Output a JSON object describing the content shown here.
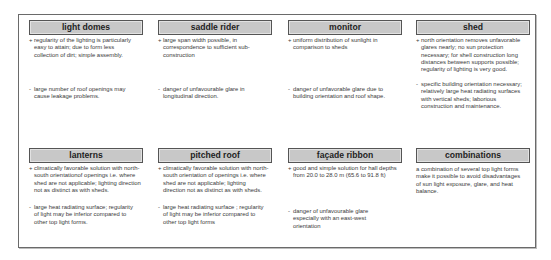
{
  "cells": [
    {
      "header": "light domes",
      "pro_symbol": "+",
      "pro": "regularity of the lighting is particularly easy to attain; due to form less collection of dirt; simple assembly.",
      "con_symbol": "-",
      "con": "large number of roof openings may cause leakage problems."
    },
    {
      "header": "saddle rider",
      "pro_symbol": "+",
      "pro": "large span width possible, in correspondence to sufficient sub-construction",
      "con_symbol": "-",
      "con": "danger of unfavourable glare in longitudinal direction."
    },
    {
      "header": "monitor",
      "pro_symbol": "+",
      "pro": "uniform distribution of sunlight in comparison to sheds",
      "con_symbol": "-",
      "con": "danger of unfavorable glare due to building orientation and roof shape."
    },
    {
      "header": "shed",
      "pro_symbol": "+",
      "pro": "north orientation removes unfavorable glares nearly; no sun protection necessary; for shell construction long distances between supports possible; regularity of lighting is very good.",
      "con_symbol": "-",
      "con": "specific building orientation necessary; relatively large heat radiating surfaces with vertical sheds; laborious construction and maintenance."
    },
    {
      "header": "lanterns",
      "pro_symbol": "+",
      "pro": "climatically favorable solution with north-south orientationof openings i.e. where shed are not applicable; lighting direction not as distinct as with sheds.",
      "con_symbol": "-",
      "con": "large heat radiating surface; regularity of light may be inferior compared to other top light forms."
    },
    {
      "header": "pitched roof",
      "pro_symbol": "+",
      "pro": "climatically favorable solution with north-south orientation of openings i.e. where shed are not applicable; lighting direction not as distinct as with sheds.",
      "con_symbol": "-",
      "con": "large heat radiating surface ; regularity of light may be inferior compared to other top light forms"
    },
    {
      "header": "façade ribbon",
      "pro_symbol": "+",
      "pro": "good and simple solution for hall depths from 20.0 to 28.0 m (65.6 to 91.8 ft)",
      "con_symbol": "-",
      "con": "danger of unfavourable glare especially with an east-west orientation"
    },
    {
      "header": "combinations",
      "text": "a combination of several top light forms make it possible to avoid disadvantages of sun light exposure, glare, and heat balance."
    }
  ]
}
